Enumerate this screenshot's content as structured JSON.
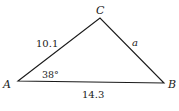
{
  "diagram": {
    "type": "triangle",
    "vertices": {
      "A": {
        "label": "A",
        "x": 18,
        "y": 81
      },
      "B": {
        "label": "B",
        "x": 164,
        "y": 83
      },
      "C": {
        "label": "C",
        "x": 100,
        "y": 18
      }
    },
    "sides": {
      "AC": {
        "label": "10.1"
      },
      "CB": {
        "label": "a"
      },
      "AB": {
        "label": "14.3"
      }
    },
    "angles": {
      "A": {
        "label": "38°"
      }
    },
    "stroke_color": "#1a1a1a"
  }
}
